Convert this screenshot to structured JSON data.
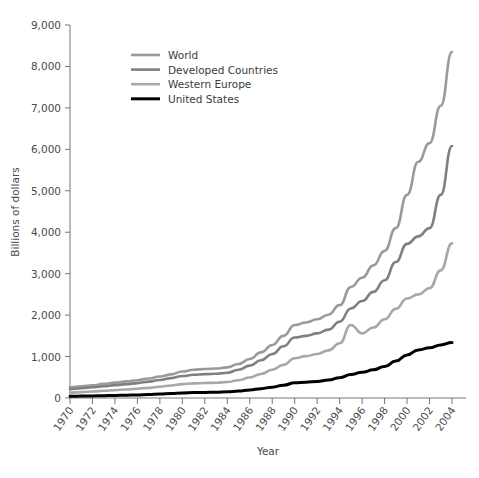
{
  "chart_data": {
    "type": "line",
    "title": "",
    "xlabel": "Year",
    "ylabel": "Billions of dollars",
    "xlim": [
      1970,
      2004
    ],
    "ylim": [
      0,
      9000
    ],
    "grid": false,
    "legend_position": "top-left",
    "x": [
      1970,
      1971,
      1972,
      1973,
      1974,
      1975,
      1976,
      1977,
      1978,
      1979,
      1980,
      1981,
      1982,
      1983,
      1984,
      1985,
      1986,
      1987,
      1988,
      1989,
      1990,
      1991,
      1992,
      1993,
      1994,
      1995,
      1996,
      1997,
      1998,
      1999,
      2000,
      2001,
      2002,
      2003,
      2004
    ],
    "xtick_labels": [
      "1970",
      "1972",
      "1974",
      "1976",
      "1978",
      "1980",
      "1982",
      "1984",
      "1986",
      "1988",
      "1990",
      "1992",
      "1994",
      "1996",
      "1998",
      "2000",
      "2002",
      "2004"
    ],
    "ytick_labels": [
      "0",
      "1,000",
      "2,000",
      "3,000",
      "4,000",
      "5,000",
      "6,000",
      "7,000",
      "8,000",
      "9,000"
    ],
    "ytick_values": [
      0,
      1000,
      2000,
      3000,
      4000,
      5000,
      6000,
      7000,
      8000,
      9000
    ],
    "series": [
      {
        "name": "World",
        "color": "#9a9a9a",
        "values": [
          260,
          280,
          305,
          340,
          370,
          400,
          430,
          470,
          520,
          570,
          640,
          680,
          700,
          710,
          740,
          820,
          940,
          1100,
          1280,
          1500,
          1760,
          1820,
          1900,
          2010,
          2240,
          2680,
          2900,
          3200,
          3550,
          4100,
          4900,
          5700,
          6150,
          7050,
          8350
        ]
      },
      {
        "name": "Developed Countries",
        "color": "#808080",
        "values": [
          215,
          235,
          258,
          285,
          310,
          335,
          360,
          395,
          435,
          480,
          530,
          560,
          575,
          585,
          610,
          680,
          780,
          910,
          1060,
          1250,
          1460,
          1500,
          1560,
          1650,
          1840,
          2160,
          2340,
          2560,
          2840,
          3280,
          3720,
          3900,
          4100,
          4900,
          6080
        ]
      },
      {
        "name": "Western Europe",
        "color": "#a8a8a8",
        "values": [
          130,
          142,
          158,
          175,
          190,
          205,
          222,
          245,
          272,
          302,
          335,
          352,
          362,
          368,
          385,
          430,
          495,
          580,
          680,
          800,
          960,
          1010,
          1060,
          1150,
          1320,
          1760,
          1560,
          1700,
          1900,
          2150,
          2400,
          2500,
          2650,
          3080,
          3730
        ]
      },
      {
        "name": "United States",
        "color": "#000000",
        "values": [
          43,
          46,
          50,
          56,
          62,
          68,
          75,
          84,
          95,
          108,
          122,
          130,
          134,
          138,
          148,
          168,
          195,
          225,
          262,
          310,
          365,
          380,
          400,
          432,
          490,
          565,
          620,
          680,
          760,
          890,
          1040,
          1160,
          1210,
          1280,
          1340
        ]
      }
    ]
  },
  "legend": {
    "items": [
      {
        "label": "World"
      },
      {
        "label": "Developed Countries"
      },
      {
        "label": "Western Europe"
      },
      {
        "label": "United States"
      }
    ]
  },
  "axes": {
    "y_title": "Billions of dollars",
    "x_title": "Year"
  }
}
